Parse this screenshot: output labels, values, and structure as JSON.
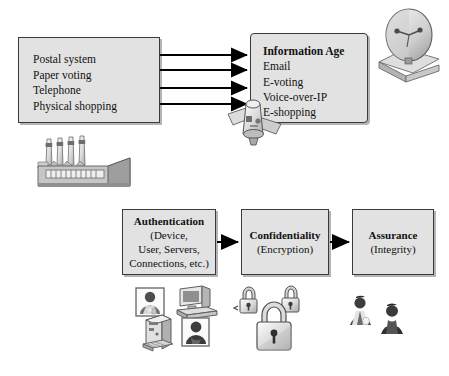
{
  "diagram": {
    "colors": {
      "box_fill": "#e2e2e2",
      "box_border": "#3a3a3a",
      "arrow": "#000000",
      "page_background": "#ffffff",
      "shadow": "#8c8c8c"
    },
    "legacy_box": {
      "name": "traditional-systems",
      "items": [
        "Postal system",
        "Paper voting",
        "Telephone",
        "Physical shopping"
      ]
    },
    "information_age_box": {
      "heading": "Information Age",
      "items": [
        "Email",
        "E-voting",
        "Voice-over-IP",
        "E-shopping"
      ]
    },
    "transition_arrows": {
      "name": "transition-arrows",
      "count": 4
    },
    "security_stages": [
      {
        "title": "Authentication",
        "subtitle": "(Device,\nUser, Servers,\nConnections, etc.)",
        "subtitle_lines": [
          "(Device,",
          "User, Servers,",
          "Connections, etc.)"
        ],
        "icons": [
          "user-badge-icon",
          "desktop-computer-icon",
          "server-tower-icon",
          "user-silhouette-icon"
        ]
      },
      {
        "title": "Confidentiality",
        "subtitle_lines": [
          "(Encryption)"
        ],
        "icons": [
          "small-padlock-icon",
          "small-padlock-icon",
          "large-padlock-icon"
        ]
      },
      {
        "title": "Assurance",
        "subtitle_lines": [
          "(Integrity)"
        ],
        "icons": [
          "person-bust-icon",
          "person-bust-icon"
        ]
      }
    ],
    "decorative_icons": [
      {
        "name": "factory-icon",
        "label": "Factory with smokestacks"
      },
      {
        "name": "satellite-dish-icon",
        "label": "Satellite ground dish"
      },
      {
        "name": "satellite-icon",
        "label": "Orbiting satellite"
      }
    ]
  }
}
